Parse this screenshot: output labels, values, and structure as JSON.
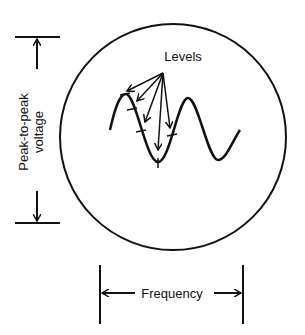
{
  "diagram": {
    "labels": {
      "levels": "Levels",
      "voltage_line1": "Peak-to-peak",
      "voltage_line2": "voltage",
      "frequency": "Frequency"
    },
    "elements": {
      "screen": "circular oscilloscope screen",
      "waveform": "sine wave",
      "level_arrows_count": 5
    },
    "colors": {
      "stroke": "#111111",
      "background": "#ffffff"
    }
  }
}
